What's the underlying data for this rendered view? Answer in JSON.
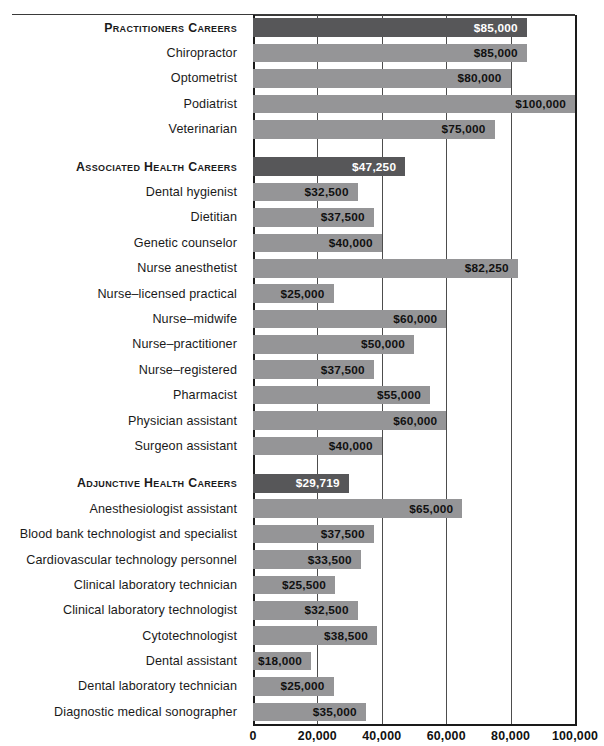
{
  "chart_data": {
    "type": "bar",
    "orientation": "horizontal",
    "title": "",
    "xlabel": "",
    "ylabel": "",
    "xlim": [
      0,
      100000
    ],
    "grid": true,
    "legend": false,
    "xticks": [
      "0",
      "20,000",
      "40,000",
      "60,000",
      "80,000",
      "100,000"
    ],
    "xtick_values": [
      0,
      20000,
      40000,
      60000,
      80000,
      100000
    ],
    "value_prefix": "$",
    "colors": {
      "section_header_bar": "#575759",
      "item_bar": "#959597",
      "axis": "#1a1a1a",
      "gridline": "#4d4d4d",
      "header_value_text": "#ffffff",
      "item_value_text": "#111111"
    },
    "sections": [
      {
        "header": {
          "label": "Practitioners Careers",
          "value": 85000,
          "value_label": "$85,000"
        },
        "items": [
          {
            "label": "Chiropractor",
            "value": 85000,
            "value_label": "$85,000"
          },
          {
            "label": "Optometrist",
            "value": 80000,
            "value_label": "$80,000"
          },
          {
            "label": "Podiatrist",
            "value": 100000,
            "value_label": "$100,000"
          },
          {
            "label": "Veterinarian",
            "value": 75000,
            "value_label": "$75,000"
          }
        ]
      },
      {
        "header": {
          "label": "Associated Health Careers",
          "value": 47250,
          "value_label": "$47,250"
        },
        "items": [
          {
            "label": "Dental hygienist",
            "value": 32500,
            "value_label": "$32,500"
          },
          {
            "label": "Dietitian",
            "value": 37500,
            "value_label": "$37,500"
          },
          {
            "label": "Genetic counselor",
            "value": 40000,
            "value_label": "$40,000"
          },
          {
            "label": "Nurse anesthetist",
            "value": 82250,
            "value_label": "$82,250"
          },
          {
            "label": "Nurse–licensed practical",
            "value": 25000,
            "value_label": "$25,000"
          },
          {
            "label": "Nurse–midwife",
            "value": 60000,
            "value_label": "$60,000"
          },
          {
            "label": "Nurse–practitioner",
            "value": 50000,
            "value_label": "$50,000"
          },
          {
            "label": "Nurse–registered",
            "value": 37500,
            "value_label": "$37,500"
          },
          {
            "label": "Pharmacist",
            "value": 55000,
            "value_label": "$55,000"
          },
          {
            "label": "Physician assistant",
            "value": 60000,
            "value_label": "$60,000"
          },
          {
            "label": "Surgeon assistant",
            "value": 40000,
            "value_label": "$40,000"
          }
        ]
      },
      {
        "header": {
          "label": "Adjunctive Health Careers",
          "value": 29719,
          "value_label": "$29,719"
        },
        "items": [
          {
            "label": "Anesthesiologist assistant",
            "value": 65000,
            "value_label": "$65,000"
          },
          {
            "label": "Blood bank technologist and specialist",
            "value": 37500,
            "value_label": "$37,500"
          },
          {
            "label": "Cardiovascular technology personnel",
            "value": 33500,
            "value_label": "$33,500"
          },
          {
            "label": "Clinical laboratory technician",
            "value": 25500,
            "value_label": "$25,500"
          },
          {
            "label": "Clinical laboratory technologist",
            "value": 32500,
            "value_label": "$32,500"
          },
          {
            "label": "Cytotechnologist",
            "value": 38500,
            "value_label": "$38,500"
          },
          {
            "label": "Dental assistant",
            "value": 18000,
            "value_label": "$18,000"
          },
          {
            "label": "Dental laboratory technician",
            "value": 25000,
            "value_label": "$25,000"
          },
          {
            "label": "Diagnostic medical sonographer",
            "value": 35000,
            "value_label": "$35,000"
          }
        ]
      }
    ]
  }
}
